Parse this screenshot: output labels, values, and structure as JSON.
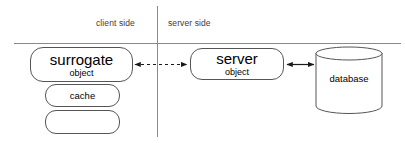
{
  "diagram": {
    "zones": {
      "client": "client side",
      "server": "server side"
    },
    "nodes": {
      "surrogate": {
        "title": "surrogate",
        "subtitle": "object"
      },
      "cache": {
        "title": "cache"
      },
      "spare": {
        "title": ""
      },
      "server_object": {
        "title": "server",
        "subtitle": "object"
      },
      "database": {
        "title": "database"
      }
    },
    "connectors": {
      "surrogate_to_server": {
        "style": "dashed",
        "arrowheads": "both"
      },
      "server_to_database": {
        "style": "solid",
        "arrowheads": "both"
      }
    },
    "dividers": {
      "vertical": "client-server boundary",
      "horizontal": "header separator"
    },
    "colors": {
      "stroke": "#555555",
      "divider": "#8a8a8a",
      "text": "#000000",
      "zone_text": "#3b3b3b",
      "background": "#ffffff"
    }
  }
}
